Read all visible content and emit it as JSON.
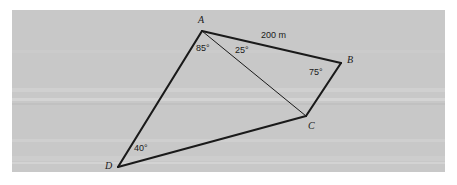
{
  "figure": {
    "type": "geometry-diagram",
    "shape": "quadrilateral-with-diagonal",
    "background_color": "#c8c8c8",
    "page_color": "#ffffff",
    "stroke_color": "#1a1a1a"
  },
  "vertices": [
    {
      "name": "A",
      "label": "A",
      "x": 202,
      "y": 31,
      "label_x": 198,
      "label_y": 15
    },
    {
      "name": "B",
      "label": "B",
      "x": 341,
      "y": 63,
      "label_x": 347,
      "label_y": 55
    },
    {
      "name": "C",
      "label": "C",
      "x": 306,
      "y": 116,
      "label_x": 308,
      "label_y": 121
    },
    {
      "name": "D",
      "label": "D",
      "x": 118,
      "y": 167,
      "label_x": 105,
      "label_y": 161
    }
  ],
  "edges": [
    {
      "name": "AB",
      "from": "A",
      "to": "B",
      "weight": "thick"
    },
    {
      "name": "BC",
      "from": "B",
      "to": "C",
      "weight": "thick"
    },
    {
      "name": "CD",
      "from": "C",
      "to": "D",
      "weight": "thick"
    },
    {
      "name": "DA",
      "from": "D",
      "to": "A",
      "weight": "thick"
    },
    {
      "name": "AC",
      "from": "A",
      "to": "C",
      "weight": "thin"
    }
  ],
  "angles": [
    {
      "name": "angle-DAC",
      "vertex": "A",
      "value": "85°",
      "label_x": 196,
      "label_y": 44
    },
    {
      "name": "angle-CAB",
      "vertex": "A",
      "value": "25°",
      "label_x": 235,
      "label_y": 46
    },
    {
      "name": "angle-ABC",
      "vertex": "B",
      "value": "75°",
      "label_x": 309,
      "label_y": 68
    },
    {
      "name": "angle-ADC",
      "vertex": "D",
      "value": "40°",
      "label_x": 134,
      "label_y": 144
    }
  ],
  "side_labels": [
    {
      "name": "side-AB-length",
      "value": "200 m",
      "label_x": 261,
      "label_y": 31
    }
  ],
  "chart_data": {
    "type": "table",
    "categories": [
      "angle DAC",
      "angle CAB",
      "angle ABC",
      "angle ADC",
      "side AB"
    ],
    "values": [
      "85°",
      "25°",
      "75°",
      "40°",
      "200 m"
    ]
  }
}
